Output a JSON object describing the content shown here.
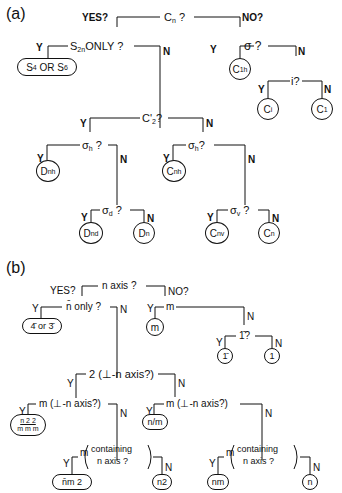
{
  "panel_a": {
    "label": "(a)",
    "root": {
      "question": "Cn ?",
      "yes": "YES?",
      "no": "NO?"
    },
    "s2n": {
      "question": "S2nONLY ?",
      "y": "Y",
      "n": "N",
      "leaf": "S4 OR S6"
    },
    "sigma": {
      "question": "σ ?",
      "y": "Y",
      "n": "N",
      "leaf": "C1h"
    },
    "inv": {
      "question": "i?",
      "y": "Y",
      "n": "N",
      "leaf_y": "Ci",
      "leaf_n": "C1"
    },
    "c2": {
      "question": "C'2?",
      "y": "Y",
      "n": "N"
    },
    "sh_left": {
      "question": "σh ?",
      "y": "Y",
      "n": "N",
      "leaf": "Dnh"
    },
    "sh_right": {
      "question": "σh?",
      "y": "Y",
      "n": "N",
      "leaf": "Cnh"
    },
    "sd": {
      "question": "σd ?",
      "y": "Y",
      "n": "N",
      "leaf_y": "Dnd",
      "leaf_n": "Dn"
    },
    "sv": {
      "question": "σv ?",
      "y": "Y",
      "n": "N",
      "leaf_y": "Cnv",
      "leaf_n": "Cn"
    }
  },
  "panel_b": {
    "label": "(b)",
    "root": {
      "question": "n axis ?",
      "yes": "YES?",
      "no": "NO?"
    },
    "nbar": {
      "question": "n̄ only ?",
      "y": "Y",
      "n": "N",
      "leaf": "4̄ or 3̄"
    },
    "m": {
      "question": "m",
      "y": "Y",
      "n": "N",
      "leaf": "m"
    },
    "onebar": {
      "question": "1̄?",
      "y": "Y",
      "n": "N",
      "leaf_y": "1̄",
      "leaf_n": "1"
    },
    "two": {
      "question": "2 (⊥-n axis?)",
      "y": "Y",
      "n": "N"
    },
    "m_perp_left": {
      "question": "m (⊥-n axis?)",
      "y": "Y",
      "n": "N",
      "leaf": "n/m 2/m 2/m"
    },
    "m_perp_right": {
      "question": "m (⊥-n axis?)",
      "y": "Y",
      "n": "N",
      "leaf": "n/m"
    },
    "m_cont_left": {
      "question_m": "m",
      "question_1": "containing",
      "question_2": "n axis ?",
      "y": "Y",
      "n": "N",
      "leaf_y": "n̄m 2",
      "leaf_n": "n2"
    },
    "m_cont_right": {
      "question_m": "m",
      "question_1": "containing",
      "question_2": "n axis ?",
      "y": "Y",
      "n": "N",
      "leaf_y": "nm",
      "leaf_n": "n"
    }
  }
}
